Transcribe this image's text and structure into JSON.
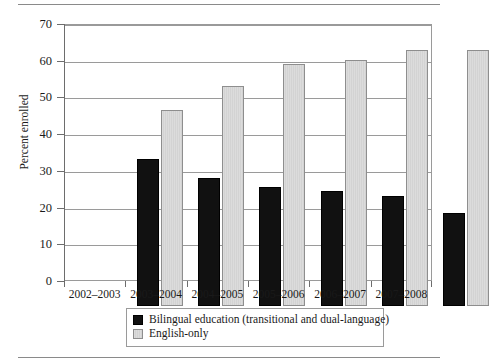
{
  "chart_data": {
    "type": "bar",
    "title": "",
    "xlabel": "",
    "ylabel": "Percent enrolled",
    "ylim": [
      0,
      70
    ],
    "yticks": [
      0,
      10,
      20,
      30,
      40,
      50,
      60,
      70
    ],
    "ytick_labels": [
      "0",
      "10",
      "20",
      "30",
      "40",
      "50",
      "60",
      "70"
    ],
    "grid": true,
    "legend_position": "bottom-center",
    "categories": [
      "2002–2003",
      "2003–2004",
      "2004–2005",
      "2005–2006",
      "2006–2007",
      "2007–2008"
    ],
    "series": [
      {
        "name": "Bilingual education (transitional and dual-language)",
        "color": "#111111",
        "values": [
          40.0,
          35.0,
          32.5,
          31.3,
          30.0,
          25.3
        ]
      },
      {
        "name": "English-only",
        "color": "#dcdcdc",
        "values": [
          53.5,
          60.0,
          66.0,
          67.0,
          69.7,
          69.6
        ]
      }
    ]
  },
  "legend": {
    "items": [
      {
        "label": "Bilingual education (transitional and dual-language)",
        "swatch": "black-square-swatch"
      },
      {
        "label": "English-only",
        "swatch": "gray-square-swatch"
      }
    ]
  }
}
